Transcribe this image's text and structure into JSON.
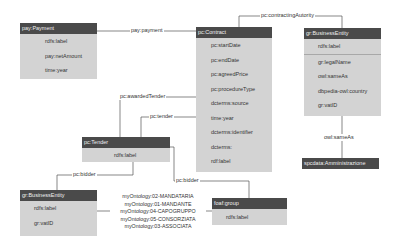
{
  "nodes": {
    "payPayment": {
      "title": "pay:Payment",
      "attributes": [
        "rdfs:label",
        "pay:netAmount",
        "time:year"
      ]
    },
    "pcContract": {
      "title": "pc:Contract",
      "attributes": [
        "pc:startDate",
        "pc:endDate",
        "pc:agreedPrice",
        "pc:procedureType",
        "dcterms:source",
        "time:year",
        "dcterms:identifier",
        "dcterms:",
        "rdf:label"
      ]
    },
    "grBusinessEntityRight": {
      "title": "gr:BusinessEntity",
      "attributes": [
        "rdfs:label",
        "gr:legalName",
        "owl:sameAs",
        "dbpedia-owl:country",
        "gr:vatID"
      ]
    },
    "pcTender": {
      "title": "pc:Tender",
      "attributes": [
        "rdfs:label"
      ]
    },
    "grBusinessEntityLeft": {
      "title": "gr:BusinessEntity",
      "attributes": [
        "rdfs:label",
        "gr:vatID"
      ]
    },
    "foafGroup": {
      "title": "foaf:group",
      "attributes": [
        "rdfs:label"
      ]
    },
    "spcdata": {
      "title": "spcdata:Amministrazione",
      "attributes": []
    }
  },
  "edges": {
    "payPayment": "pay:payment",
    "contractingAuthority": "pc:contractingAutority",
    "awardedTender": "pc:awardedTender",
    "tender": "pc:tender",
    "bidderLeft": "pc:bidder",
    "bidderRight": "pc:bidder",
    "sameAs": "owl:sameAs",
    "membership": [
      "myOntology:02-MANDATARIA",
      "myOntology:01-MANDANTE",
      "myOntology:04-CAPOGRUPPO",
      "myOntology:05-CONSORZIATA",
      "myOntology:03-ASSOCIATA"
    ]
  },
  "colors": {
    "header": "#4a4a4a",
    "body": "#d3d3d3",
    "line": "#555555",
    "background": "#ffffff"
  }
}
